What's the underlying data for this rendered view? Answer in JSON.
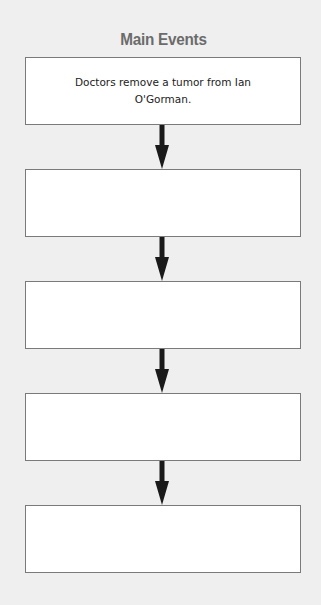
{
  "diagram": {
    "title": "Main Events",
    "events": [
      {
        "text": "Doctors remove a tumor from Ian O'Gorman."
      },
      {
        "text": ""
      },
      {
        "text": ""
      },
      {
        "text": ""
      },
      {
        "text": ""
      }
    ],
    "connector": "down-arrow",
    "colors": {
      "background": "#efefef",
      "box_fill": "#ffffff",
      "box_border": "#7a7a7a",
      "title": "#6b6b6b",
      "arrow": "#1a1a1a"
    }
  }
}
